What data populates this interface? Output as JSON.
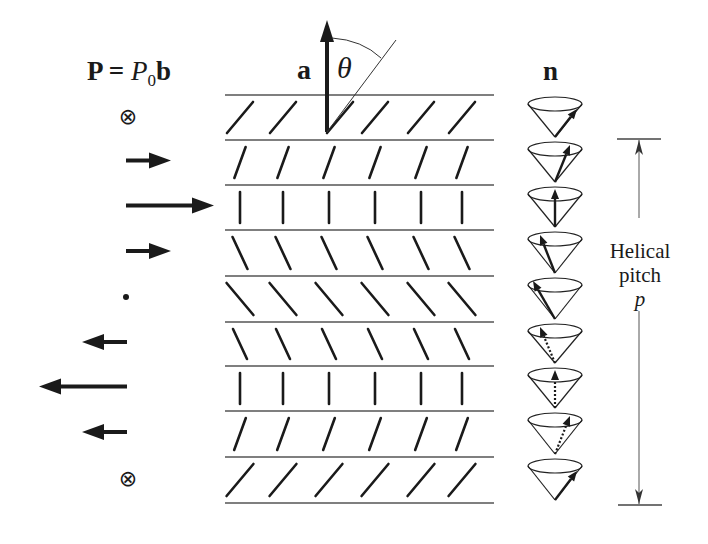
{
  "figure": {
    "polarization_label": {
      "P": "P",
      "eq": " = ",
      "P0": "P",
      "sub0": "0",
      "b": "b"
    },
    "axis_label": "a",
    "angle_label": "θ",
    "director_label": "n",
    "pitch_label": {
      "line1": "Helical",
      "line2": "pitch",
      "symbol": "p"
    }
  },
  "layers": {
    "y_positions": [
      95,
      140,
      185,
      230,
      276,
      322,
      366,
      411,
      457,
      503
    ],
    "x_start": 225,
    "x_end": 494,
    "molecule_columns": [
      240,
      283,
      329,
      375,
      421,
      462
    ],
    "molecule_orientations_deg": [
      40,
      20,
      0,
      -25,
      -40,
      -25,
      0,
      20,
      40
    ],
    "molecule_orientations_desc": [
      "tilt-right-strong",
      "tilt-right-weak",
      "vertical",
      "tilt-left-weak",
      "tilt-left-strong",
      "tilt-left-weak",
      "vertical",
      "tilt-right-weak",
      "tilt-right-strong"
    ]
  },
  "polarization_arrows": [
    {
      "row": 0,
      "type": "into-page",
      "symbol": "⊗"
    },
    {
      "row": 1,
      "type": "right",
      "length": "short"
    },
    {
      "row": 2,
      "type": "right",
      "length": "long"
    },
    {
      "row": 3,
      "type": "right",
      "length": "short"
    },
    {
      "row": 4,
      "type": "dot",
      "symbol": "•"
    },
    {
      "row": 5,
      "type": "left",
      "length": "short"
    },
    {
      "row": 6,
      "type": "left",
      "length": "long"
    },
    {
      "row": 7,
      "type": "left",
      "length": "short"
    },
    {
      "row": 8,
      "type": "into-page",
      "symbol": "⊗"
    }
  ],
  "cones": [
    {
      "index": 0,
      "arrow": "front-right",
      "dashed": false
    },
    {
      "index": 1,
      "arrow": "back-right",
      "dashed": false
    },
    {
      "index": 2,
      "arrow": "back-center",
      "dashed": false
    },
    {
      "index": 3,
      "arrow": "back-left",
      "dashed": false
    },
    {
      "index": 4,
      "arrow": "front-left",
      "dashed": false
    },
    {
      "index": 5,
      "arrow": "back-left",
      "dashed": true
    },
    {
      "index": 6,
      "arrow": "back-center",
      "dashed": true
    },
    {
      "index": 7,
      "arrow": "back-right",
      "dashed": true
    },
    {
      "index": 8,
      "arrow": "front-right",
      "dashed": false
    }
  ],
  "colors": {
    "ink": "#1a1a1a",
    "line": "#555555",
    "background": "#ffffff"
  }
}
